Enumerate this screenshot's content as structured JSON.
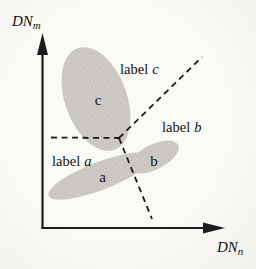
{
  "colors": {
    "line": "#1c1c1c",
    "text": "#141414",
    "cluster_base": "#d7d4cf",
    "cluster_dot_dark": "#a19e99",
    "cluster_dot_mid": "#b5b2ad"
  },
  "axes": {
    "y": {
      "base": "DN",
      "subscript": "m"
    },
    "x": {
      "base": "DN",
      "subscript": "n"
    }
  },
  "clusters": {
    "c": {
      "letter": "c"
    },
    "a": {
      "letter": "a"
    },
    "b": {
      "letter": "b"
    }
  },
  "regions": {
    "c": {
      "word": "label",
      "letter": "c"
    },
    "b": {
      "word": "label",
      "letter": "b"
    },
    "a": {
      "word": "label",
      "letter": "a"
    }
  }
}
